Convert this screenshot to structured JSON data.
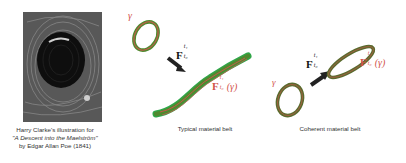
{
  "illustration": {
    "caption_line1": "Harry Clarke's illustration for",
    "caption_line2": "\"A Descent into the Maelström\"",
    "caption_line3": "by Edgar Allan Poe (1841)"
  },
  "typical_panel": {
    "gamma_label": "γ",
    "flow_map_label": "F",
    "flow_map_sup": "t₁",
    "flow_map_sub": "t₀",
    "image_label": "F",
    "image_label_sup": "t₁",
    "image_label_sub": "t₀",
    "image_label_arg": "(γ)",
    "caption": "Typical material belt"
  },
  "coherent_panel": {
    "gamma_label": "γ",
    "flow_map_label": "F",
    "flow_map_sup": "t₁",
    "flow_map_sub": "t₀",
    "image_label": "F",
    "image_label_sup": "t₁",
    "image_label_sub": "t₀",
    "image_label_arg": "(γ)",
    "caption": "Coherent material belt"
  },
  "colors": {
    "belt_outer": "#4f8a2f",
    "belt_green": "#2fa84a",
    "belt_red": "#c5594a",
    "label_red": "#d2544a",
    "arrow": "#222222"
  }
}
